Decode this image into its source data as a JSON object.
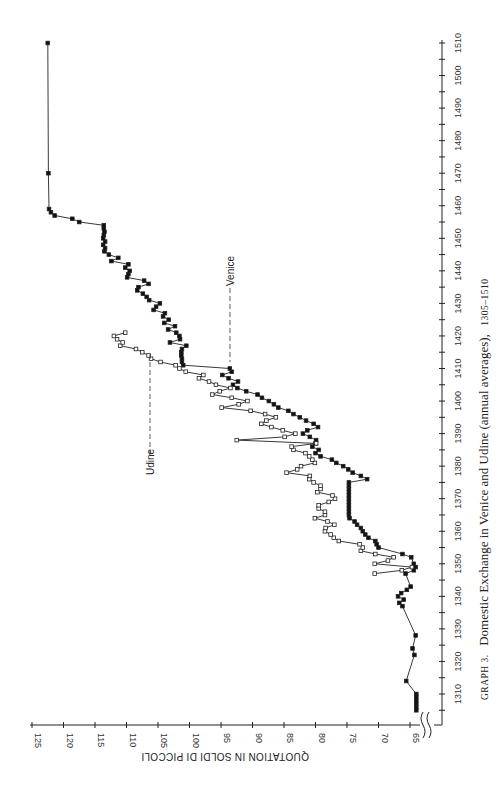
{
  "chart_data": {
    "type": "line",
    "orientation_note": "figure printed rotated 90 degrees",
    "title_prefix": "GRAPH 3.",
    "title": "Domestic Exchange in Venice and Udine (annual averages),",
    "title_range": "1305–1510",
    "xlabel": "",
    "ylabel": "QUOTATION IN SOLDI DI PICCOLI",
    "xlim": [
      1300,
      1510
    ],
    "ylim": [
      62,
      125
    ],
    "x_ticks": [
      1310,
      1320,
      1330,
      1340,
      1350,
      1360,
      1370,
      1380,
      1390,
      1400,
      1410,
      1420,
      1430,
      1440,
      1450,
      1460,
      1470,
      1480,
      1490,
      1500,
      1510
    ],
    "y_ticks": [
      125,
      120,
      115,
      110,
      105,
      100,
      95,
      90,
      85,
      80,
      75,
      70,
      65
    ],
    "axis_break": "y-axis broken below 65",
    "annotations": [
      {
        "text": "Udine",
        "series": "Udine"
      },
      {
        "text": "Venice",
        "series": "Venice"
      }
    ],
    "series": [
      {
        "name": "Venice",
        "marker": "filled-square",
        "points": [
          [
            1305,
            64
          ],
          [
            1306,
            64
          ],
          [
            1307,
            64
          ],
          [
            1308,
            64
          ],
          [
            1309,
            64
          ],
          [
            1310,
            64
          ],
          [
            1314,
            65.6
          ],
          [
            1322,
            64.3
          ],
          [
            1324,
            64.6
          ],
          [
            1328,
            64.1
          ],
          [
            1337,
            66.2
          ],
          [
            1338,
            66.7
          ],
          [
            1339,
            66
          ],
          [
            1340,
            66.9
          ],
          [
            1341,
            66.4
          ],
          [
            1342,
            65.5
          ],
          [
            1343,
            64.9
          ],
          [
            1347,
            65.7
          ],
          [
            1348,
            64.4
          ],
          [
            1349,
            64.1
          ],
          [
            1350,
            64.4
          ],
          [
            1352,
            64.8
          ],
          [
            1353,
            66.2
          ],
          [
            1355,
            70
          ],
          [
            1356,
            70.3
          ],
          [
            1357,
            70.5
          ],
          [
            1358,
            71.6
          ],
          [
            1359,
            72.1
          ],
          [
            1360,
            72.5
          ],
          [
            1361,
            72.8
          ],
          [
            1362,
            73.4
          ],
          [
            1363,
            73.8
          ],
          [
            1364,
            74.6
          ],
          [
            1365,
            74.7
          ],
          [
            1366,
            74.7
          ],
          [
            1367,
            74.7
          ],
          [
            1368,
            74.7
          ],
          [
            1369,
            74.7
          ],
          [
            1370,
            74.7
          ],
          [
            1371,
            74.7
          ],
          [
            1372,
            74.7
          ],
          [
            1373,
            74.7
          ],
          [
            1374,
            74.7
          ],
          [
            1375,
            74.7
          ],
          [
            1376,
            71.8
          ],
          [
            1377,
            72.8
          ],
          [
            1378,
            74.1
          ],
          [
            1379,
            74.8
          ],
          [
            1380,
            75.6
          ],
          [
            1381,
            76.7
          ],
          [
            1382,
            77.4
          ],
          [
            1383,
            79.2
          ],
          [
            1384,
            80
          ],
          [
            1385,
            79.5
          ],
          [
            1386,
            80.5
          ],
          [
            1387,
            80
          ],
          [
            1388,
            79.9
          ],
          [
            1389,
            80.9
          ],
          [
            1390,
            82
          ],
          [
            1391,
            81.3
          ],
          [
            1392,
            79.6
          ],
          [
            1393,
            80.3
          ],
          [
            1394,
            81.5
          ],
          [
            1395,
            82.5
          ],
          [
            1396,
            83.5
          ],
          [
            1397,
            84.3
          ],
          [
            1398,
            85.9
          ],
          [
            1399,
            86.6
          ],
          [
            1400,
            87.4
          ],
          [
            1401,
            88.5
          ],
          [
            1402,
            89.2
          ],
          [
            1403,
            91
          ],
          [
            1404,
            92.4
          ],
          [
            1405,
            93.1
          ],
          [
            1406,
            92.3
          ],
          [
            1407,
            93.8
          ],
          [
            1408,
            94.8
          ],
          [
            1409,
            93.3
          ],
          [
            1410,
            93.6
          ],
          [
            1411,
            101
          ],
          [
            1412,
            101.2
          ],
          [
            1413,
            101.2
          ],
          [
            1414,
            101.3
          ],
          [
            1415,
            101.3
          ],
          [
            1416,
            101.2
          ],
          [
            1417,
            100.5
          ],
          [
            1418,
            103.1
          ],
          [
            1419,
            101.5
          ],
          [
            1420,
            101.6
          ],
          [
            1421,
            102.1
          ],
          [
            1422,
            103.4
          ],
          [
            1423,
            102.3
          ],
          [
            1424,
            104
          ],
          [
            1425,
            103.3
          ],
          [
            1426,
            104.2
          ],
          [
            1427,
            103.9
          ],
          [
            1428,
            105.7
          ],
          [
            1429,
            105.3
          ],
          [
            1430,
            104.7
          ],
          [
            1431,
            106.4
          ],
          [
            1432,
            106.8
          ],
          [
            1433,
            107.4
          ],
          [
            1434,
            108.3
          ],
          [
            1435,
            108.1
          ],
          [
            1436,
            106.5
          ],
          [
            1437,
            107.2
          ],
          [
            1438,
            109.9
          ],
          [
            1439,
            109.7
          ],
          [
            1440,
            109.5
          ],
          [
            1441,
            110.2
          ],
          [
            1442,
            109.7
          ],
          [
            1443,
            112.4
          ],
          [
            1444,
            111.3
          ],
          [
            1445,
            112.8
          ],
          [
            1446,
            113.5
          ],
          [
            1447,
            113.4
          ],
          [
            1448,
            113.7
          ],
          [
            1449,
            113.4
          ],
          [
            1450,
            113.7
          ],
          [
            1451,
            113.6
          ],
          [
            1452,
            113.5
          ],
          [
            1453,
            113.6
          ],
          [
            1454,
            113.6
          ],
          [
            1455,
            117.5
          ],
          [
            1456,
            118.6
          ],
          [
            1457,
            121.4
          ],
          [
            1458,
            122
          ],
          [
            1459,
            122.3
          ],
          [
            1470,
            122.4
          ],
          [
            1510,
            122.5
          ]
        ]
      },
      {
        "name": "Udine",
        "marker": "open-square",
        "points": [
          [
            1347,
            70.6
          ],
          [
            1348,
            66.3
          ],
          [
            1349,
            64.7
          ],
          [
            1350,
            70.6
          ],
          [
            1351,
            68.5
          ],
          [
            1352,
            67.6
          ],
          [
            1353,
            70.5
          ],
          [
            1354,
            72.8
          ],
          [
            1355,
            72.5
          ],
          [
            1356,
            73
          ],
          [
            1357,
            76.3
          ],
          [
            1358,
            77.1
          ],
          [
            1359,
            77.6
          ],
          [
            1360,
            78.5
          ],
          [
            1361,
            78.4
          ],
          [
            1362,
            77
          ],
          [
            1363,
            78.1
          ],
          [
            1364,
            80.1
          ],
          [
            1365,
            78.5
          ],
          [
            1366,
            78.5
          ],
          [
            1367,
            79.5
          ],
          [
            1368,
            79.5
          ],
          [
            1369,
            77.9
          ],
          [
            1370,
            76.9
          ],
          [
            1371,
            77.3
          ],
          [
            1372,
            79.7
          ],
          [
            1373,
            79.2
          ],
          [
            1374,
            79.2
          ],
          [
            1375,
            80.3
          ],
          [
            1376,
            81
          ],
          [
            1377,
            80.9
          ],
          [
            1378,
            84.6
          ],
          [
            1379,
            82.9
          ],
          [
            1380,
            82.3
          ],
          [
            1381,
            80.1
          ],
          [
            1382,
            80.5
          ],
          [
            1383,
            81
          ],
          [
            1384,
            81.6
          ],
          [
            1385,
            83.5
          ],
          [
            1386,
            83.8
          ],
          [
            1387,
            79.9
          ],
          [
            1388,
            92.5
          ],
          [
            1389,
            84.9
          ],
          [
            1390,
            83.2
          ],
          [
            1391,
            85.2
          ],
          [
            1392,
            87
          ],
          [
            1393,
            88.6
          ],
          [
            1394,
            87.8
          ],
          [
            1395,
            86.3
          ],
          [
            1396,
            88
          ],
          [
            1397,
            90.3
          ],
          [
            1398,
            94.9
          ],
          [
            1399,
            92.2
          ],
          [
            1400,
            90.8
          ],
          [
            1401,
            93.3
          ],
          [
            1402,
            96.4
          ],
          [
            1403,
            95.2
          ],
          [
            1404,
            93.5
          ],
          [
            1405,
            95.8
          ],
          [
            1406,
            96.9
          ],
          [
            1407,
            98.5
          ],
          [
            1408,
            97.8
          ],
          [
            1409,
            100.6
          ],
          [
            1410,
            101.6
          ],
          [
            1411,
            102.2
          ],
          [
            1412,
            104.6
          ],
          [
            1413,
            106.1
          ],
          [
            1414,
            106.5
          ],
          [
            1415,
            107.5
          ],
          [
            1416,
            108.5
          ],
          [
            1417,
            111
          ],
          [
            1418,
            110.6
          ],
          [
            1419,
            111.5
          ],
          [
            1420,
            112
          ],
          [
            1421,
            110.2
          ]
        ]
      }
    ]
  }
}
